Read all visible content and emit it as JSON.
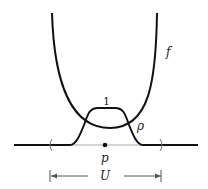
{
  "diagram": {
    "type": "bump-function-illustration",
    "labels": {
      "function_f": "f",
      "bump_rho": "ρ",
      "bump_max": "1",
      "point": "p",
      "neighborhood": "U"
    },
    "elements": [
      {
        "name": "f",
        "description": "convex U-shaped curve with minimum near p"
      },
      {
        "name": "ρ",
        "description": "bump function equal to 1 near p, 0 outside U"
      },
      {
        "name": "p",
        "description": "point on the baseline"
      },
      {
        "name": "U",
        "description": "open neighborhood of p, shown with parentheses and arrows"
      }
    ],
    "colors": {
      "stroke": "#111111",
      "thin_line": "#888888",
      "background": "#ffffff"
    }
  }
}
